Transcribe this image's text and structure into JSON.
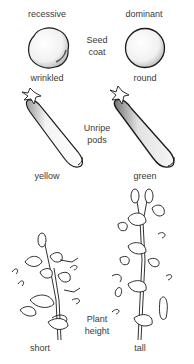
{
  "columns": {
    "left": "recessive",
    "right": "dominant"
  },
  "traits": [
    {
      "name_line1": "Seed",
      "name_line2": "coat",
      "recessive": "wrinkled",
      "dominant": "round"
    },
    {
      "name_line1": "Unripe",
      "name_line2": "pods",
      "recessive": "yellow",
      "dominant": "green"
    },
    {
      "name_line1": "Plant",
      "name_line2": "height",
      "recessive": "short",
      "dominant": "tall"
    }
  ],
  "icons": {
    "wrinkled_seed": "wrinkled-pea-seed-illustration",
    "round_seed": "round-pea-seed-illustration",
    "yellow_pod": "pea-pod-illustration",
    "green_pod": "pea-pod-illustration",
    "short_plant": "pea-plant-illustration",
    "tall_plant": "pea-plant-illustration"
  },
  "colors": {
    "ink": "#1a1a1a",
    "text": "#3a3a3a",
    "background": "#ffffff"
  }
}
